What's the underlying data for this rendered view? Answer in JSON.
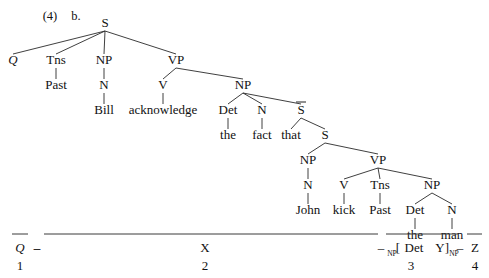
{
  "figure": {
    "example_number": "(4)",
    "sub_label": "b."
  },
  "tree": {
    "nodes": [
      {
        "id": "S0",
        "label": "S",
        "x": 105,
        "y": 27,
        "italic": false,
        "overbar": false
      },
      {
        "id": "Q",
        "label": "Q",
        "x": 13,
        "y": 64,
        "italic": true,
        "overbar": false
      },
      {
        "id": "Tns1",
        "label": "Tns",
        "x": 56,
        "y": 64,
        "italic": false,
        "overbar": false
      },
      {
        "id": "Past1",
        "label": "Past",
        "x": 56,
        "y": 89,
        "italic": false,
        "overbar": false
      },
      {
        "id": "NP1",
        "label": "NP",
        "x": 104,
        "y": 64,
        "italic": false,
        "overbar": false
      },
      {
        "id": "N1",
        "label": "N",
        "x": 104,
        "y": 89,
        "italic": false,
        "overbar": false
      },
      {
        "id": "Bill",
        "label": "Bill",
        "x": 104,
        "y": 114,
        "italic": false,
        "overbar": false
      },
      {
        "id": "VP1",
        "label": "VP",
        "x": 176,
        "y": 64,
        "italic": false,
        "overbar": false
      },
      {
        "id": "V1",
        "label": "V",
        "x": 163,
        "y": 89,
        "italic": false,
        "overbar": false
      },
      {
        "id": "ackn",
        "label": "acknowledge",
        "x": 163,
        "y": 114,
        "italic": false,
        "overbar": false
      },
      {
        "id": "NP2",
        "label": "NP",
        "x": 243,
        "y": 89,
        "italic": false,
        "overbar": false
      },
      {
        "id": "Det1",
        "label": "Det",
        "x": 228,
        "y": 114,
        "italic": false,
        "overbar": false
      },
      {
        "id": "the1",
        "label": "the",
        "x": 228,
        "y": 139,
        "italic": false,
        "overbar": false
      },
      {
        "id": "N2",
        "label": "N",
        "x": 262,
        "y": 114,
        "italic": false,
        "overbar": false
      },
      {
        "id": "fact",
        "label": "fact",
        "x": 262,
        "y": 139,
        "italic": false,
        "overbar": false
      },
      {
        "id": "Sbar",
        "label": "S",
        "x": 301,
        "y": 114,
        "italic": false,
        "overbar": true
      },
      {
        "id": "that",
        "label": "that",
        "x": 291,
        "y": 139,
        "italic": false,
        "overbar": false
      },
      {
        "id": "S1",
        "label": "S",
        "x": 325,
        "y": 139,
        "italic": false,
        "overbar": false
      },
      {
        "id": "NP3",
        "label": "NP",
        "x": 308,
        "y": 164,
        "italic": false,
        "overbar": false
      },
      {
        "id": "N3",
        "label": "N",
        "x": 308,
        "y": 189,
        "italic": false,
        "overbar": false
      },
      {
        "id": "John",
        "label": "John",
        "x": 308,
        "y": 214,
        "italic": false,
        "overbar": false
      },
      {
        "id": "VP2",
        "label": "VP",
        "x": 378,
        "y": 164,
        "italic": false,
        "overbar": false
      },
      {
        "id": "V2",
        "label": "V",
        "x": 344,
        "y": 189,
        "italic": false,
        "overbar": false
      },
      {
        "id": "kick",
        "label": "kick",
        "x": 344,
        "y": 214,
        "italic": false,
        "overbar": false
      },
      {
        "id": "Tns2",
        "label": "Tns",
        "x": 380,
        "y": 189,
        "italic": false,
        "overbar": false
      },
      {
        "id": "Past2",
        "label": "Past",
        "x": 380,
        "y": 214,
        "italic": false,
        "overbar": false
      },
      {
        "id": "NP4",
        "label": "NP",
        "x": 432,
        "y": 189,
        "italic": false,
        "overbar": false
      },
      {
        "id": "Det2",
        "label": "Det",
        "x": 415,
        "y": 214,
        "italic": false,
        "overbar": false
      },
      {
        "id": "the2",
        "label": "the",
        "x": 415,
        "y": 239,
        "italic": false,
        "overbar": false
      },
      {
        "id": "N4",
        "label": "N",
        "x": 452,
        "y": 214,
        "italic": false,
        "overbar": false
      },
      {
        "id": "man",
        "label": "man",
        "x": 452,
        "y": 239,
        "italic": false,
        "overbar": false
      }
    ],
    "edges": [
      [
        "S0",
        "Q"
      ],
      [
        "S0",
        "Tns1"
      ],
      [
        "S0",
        "NP1"
      ],
      [
        "S0",
        "VP1"
      ],
      [
        "Tns1",
        "Past1"
      ],
      [
        "NP1",
        "N1"
      ],
      [
        "N1",
        "Bill"
      ],
      [
        "VP1",
        "V1"
      ],
      [
        "V1",
        "ackn"
      ],
      [
        "VP1",
        "NP2"
      ],
      [
        "NP2",
        "Det1"
      ],
      [
        "Det1",
        "the1"
      ],
      [
        "NP2",
        "N2"
      ],
      [
        "N2",
        "fact"
      ],
      [
        "NP2",
        "Sbar"
      ],
      [
        "Sbar",
        "that"
      ],
      [
        "Sbar",
        "S1"
      ],
      [
        "S1",
        "NP3"
      ],
      [
        "NP3",
        "N3"
      ],
      [
        "N3",
        "John"
      ],
      [
        "S1",
        "VP2"
      ],
      [
        "VP2",
        "V2"
      ],
      [
        "V2",
        "kick"
      ],
      [
        "VP2",
        "Tns2"
      ],
      [
        "Tns2",
        "Past2"
      ],
      [
        "VP2",
        "NP4"
      ],
      [
        "NP4",
        "Det2"
      ],
      [
        "Det2",
        "the2"
      ],
      [
        "NP4",
        "N4"
      ],
      [
        "N4",
        "man"
      ]
    ]
  },
  "analysis": {
    "terms": [
      {
        "id": "term-Q",
        "symbol": "Q",
        "italic": true,
        "overbar": true,
        "index": "1",
        "rule_x1": 12,
        "rule_x2": 28,
        "label_x": 20,
        "dash_after": true,
        "dash_x": 37
      },
      {
        "id": "term-X",
        "symbol": "X",
        "italic": false,
        "overbar": true,
        "index": "2",
        "rule_x1": 44,
        "rule_x2": 378,
        "label_x": 205,
        "dash_after": false,
        "dash_x": null
      },
      {
        "id": "term-Det",
        "symbol": "Det",
        "italic": false,
        "overbar": true,
        "index": "3",
        "rule_x1": 386,
        "rule_x2": 458,
        "label_x": 411,
        "dash_after": false,
        "dash_x": 381
      },
      {
        "id": "term-Z",
        "symbol": "Z",
        "italic": false,
        "overbar": true,
        "index": "4",
        "rule_x1": 467,
        "rule_x2": 482,
        "label_x": 475,
        "dash_after": false,
        "dash_x": 460
      }
    ],
    "bracket_open": "[",
    "bracket_close": "]",
    "bracket_open_sub": "NP",
    "bracket_close_sub": "NP",
    "y_symbol": "Y",
    "dash": "–"
  }
}
